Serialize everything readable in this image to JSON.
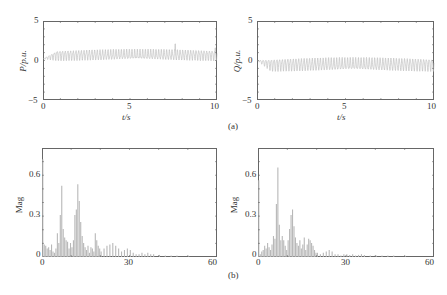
{
  "figure": {
    "subfigure_labels": [
      "(a)",
      "(b)"
    ]
  },
  "chart_data": [
    {
      "id": "P_time",
      "type": "line",
      "title": "",
      "xlabel": "t/s",
      "ylabel": "P/p.u.",
      "xlim": [
        0,
        10
      ],
      "ylim": [
        -5,
        5
      ],
      "xticks": [
        "0",
        "5",
        "10"
      ],
      "yticks": [
        "5",
        "0",
        "−5"
      ],
      "grid": false,
      "series": [
        {
          "name": "P",
          "color": "#b8b8b8",
          "description": "oscillating signal around ~0.7 p.u., amplitude ~0.6, occasional spikes up to ~2",
          "mean": 0.7,
          "amplitude": 0.55,
          "frequency_hz": 6.5,
          "start_value": 0.2,
          "spikes": [
            [
              7.6,
              2.1
            ],
            [
              9.9,
              1.6
            ]
          ]
        }
      ]
    },
    {
      "id": "Q_time",
      "type": "line",
      "title": "",
      "xlabel": "t/s",
      "ylabel": "Q/p.u.",
      "xlim": [
        0,
        10
      ],
      "ylim": [
        -5,
        5
      ],
      "xticks": [
        "0",
        "5",
        "10"
      ],
      "yticks": [
        "5",
        "0",
        "−5"
      ],
      "grid": false,
      "series": [
        {
          "name": "Q",
          "color": "#b8b8b8",
          "description": "oscillating signal around ~-0.5 p.u., amplitude ~0.7",
          "mean": -0.5,
          "amplitude": 0.7,
          "frequency_hz": 6.5,
          "start_value": 0.0,
          "spikes": []
        }
      ]
    },
    {
      "id": "P_spectrum",
      "type": "bar",
      "title": "",
      "xlabel": "",
      "ylabel": "Mag",
      "xlim": [
        0,
        60
      ],
      "ylim": [
        0,
        0.78
      ],
      "xticks": [
        "0",
        "30",
        "60"
      ],
      "yticks": [
        "0.6",
        "0.3",
        "0"
      ],
      "grid": false,
      "x": [
        0,
        0.5,
        1,
        1.5,
        2,
        2.5,
        3,
        3.5,
        4,
        4.5,
        5,
        5.5,
        6,
        6.5,
        7,
        7.5,
        8,
        8.5,
        9,
        9.5,
        10,
        10.5,
        11,
        11.5,
        12,
        12.5,
        13,
        13.5,
        14,
        14.5,
        15,
        15.5,
        16,
        16.5,
        17,
        17.5,
        18,
        18.5,
        19,
        19.5,
        20,
        21,
        22,
        23,
        24,
        25,
        26,
        27,
        28,
        29,
        30,
        31,
        32,
        33,
        34,
        35,
        36,
        37,
        38,
        40,
        42,
        44,
        46,
        50
      ],
      "values": [
        0.7,
        0.09,
        0.08,
        0.06,
        0.07,
        0.05,
        0.09,
        0.04,
        0.03,
        0.06,
        0.17,
        0.1,
        0.3,
        0.51,
        0.2,
        0.14,
        0.12,
        0.11,
        0.06,
        0.1,
        0.07,
        0.12,
        0.3,
        0.34,
        0.52,
        0.4,
        0.25,
        0.15,
        0.1,
        0.07,
        0.05,
        0.08,
        0.03,
        0.07,
        0.06,
        0.04,
        0.17,
        0.12,
        0.08,
        0.06,
        0.04,
        0.06,
        0.08,
        0.09,
        0.1,
        0.08,
        0.06,
        0.04,
        0.05,
        0.06,
        0.05,
        0.03,
        0.02,
        0.02,
        0.03,
        0.02,
        0.03,
        0.02,
        0.02,
        0.015,
        0.01,
        0.01,
        0.01,
        0.005
      ],
      "color": "#b8b8b8"
    },
    {
      "id": "Q_spectrum",
      "type": "bar",
      "title": "",
      "xlabel": "",
      "ylabel": "Mag",
      "xlim": [
        0,
        60
      ],
      "ylim": [
        0,
        0.78
      ],
      "xticks": [
        "0",
        "30",
        "60"
      ],
      "yticks": [
        "0.6",
        "0.3",
        "0"
      ],
      "grid": false,
      "x": [
        0,
        0.5,
        1,
        1.5,
        2,
        2.5,
        3,
        3.5,
        4,
        4.5,
        5,
        5.5,
        6,
        6.5,
        7,
        7.5,
        8,
        8.5,
        9,
        9.5,
        10,
        10.5,
        11,
        11.5,
        12,
        12.5,
        13,
        13.5,
        14,
        14.5,
        15,
        15.5,
        16,
        16.5,
        17,
        17.5,
        18,
        18.5,
        19,
        19.5,
        20,
        21,
        22,
        23,
        24,
        25,
        26,
        27,
        28,
        29,
        30,
        31,
        32,
        33,
        34,
        35,
        36,
        38,
        40,
        42,
        44,
        46,
        50
      ],
      "values": [
        0.55,
        0.02,
        0.04,
        0.05,
        0.08,
        0.06,
        0.1,
        0.07,
        0.05,
        0.09,
        0.15,
        0.13,
        0.38,
        0.64,
        0.23,
        0.12,
        0.15,
        0.12,
        0.08,
        0.05,
        0.12,
        0.2,
        0.3,
        0.34,
        0.22,
        0.14,
        0.1,
        0.08,
        0.12,
        0.06,
        0.09,
        0.14,
        0.05,
        0.09,
        0.13,
        0.12,
        0.1,
        0.08,
        0.05,
        0.03,
        0.03,
        0.02,
        0.03,
        0.04,
        0.05,
        0.04,
        0.02,
        0.02,
        0.01,
        0.02,
        0.02,
        0.015,
        0.02,
        0.01,
        0.015,
        0.02,
        0.015,
        0.01,
        0.01,
        0.01,
        0.01,
        0.01,
        0.005
      ],
      "color": "#b8b8b8"
    }
  ]
}
